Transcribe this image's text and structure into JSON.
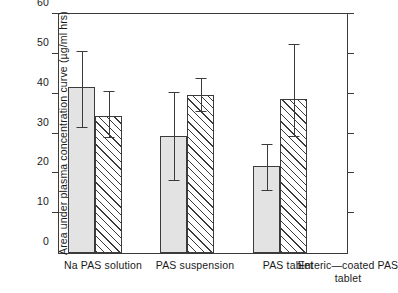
{
  "chart_data": {
    "type": "bar",
    "title": "",
    "subtitle": "",
    "xlabel": "",
    "ylabel": "Area under plasma concentration curve (µg/ml hrs)",
    "ylim": [
      0,
      60
    ],
    "yticks": [
      0,
      10,
      20,
      30,
      40,
      50,
      60
    ],
    "ytick_labels": [
      "0",
      "10",
      "20",
      "30",
      "40",
      "50",
      "60"
    ],
    "grid": false,
    "legend": "none",
    "categories": [
      "Na PAS solution",
      "PAS suspension",
      "PAS tablet",
      "Enteric—coated PAS tablet"
    ],
    "series": [
      {
        "name": "stippled",
        "fill": "solid-light-grey",
        "values": [
          41.8,
          29.4,
          21.8,
          null
        ],
        "err_upper": [
          50.4,
          40.2,
          27.0,
          null
        ],
        "err_lower": [
          31.5,
          18.0,
          15.6,
          null
        ]
      },
      {
        "name": "hatched",
        "fill": "diagonal-hatch",
        "values": [
          34.4,
          39.6,
          38.6,
          null
        ],
        "err_upper": [
          40.3,
          43.7,
          52.1,
          null
        ],
        "err_lower": [
          28.8,
          35.4,
          29.0,
          null
        ]
      }
    ]
  },
  "axis": {
    "ytick_labels": [
      "60",
      "50",
      "40",
      "30",
      "20",
      "10",
      "0"
    ],
    "ytitle": "Area under plasma concentration curve (µg/ml hrs)"
  },
  "xlabels": [
    {
      "line1": "Na PAS solution",
      "line2": ""
    },
    {
      "line1": "PAS suspension",
      "line2": ""
    },
    {
      "line1": "PAS tablet",
      "line2": ""
    },
    {
      "line1": "Enteric—coated PAS",
      "line2": "tablet"
    }
  ],
  "colors": {
    "ink": "#3b3b3b",
    "bar_solid": "#e3e3e3",
    "background": "#ffffff"
  }
}
